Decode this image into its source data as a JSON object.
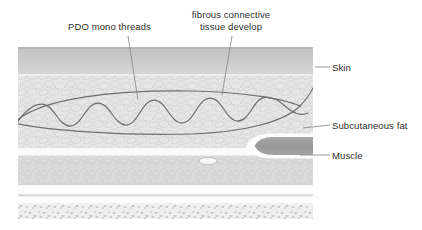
{
  "figure": {
    "callouts": [
      {
        "id": "pdo-mono-threads",
        "text": "PDO mono threads"
      },
      {
        "id": "fibrous-connective-tissue",
        "line1": "fibrous connective",
        "line2": "tissue develop"
      },
      {
        "id": "skin",
        "text": "Skin"
      },
      {
        "id": "subcutaneous-fat",
        "text": "Subcutaneous fat"
      },
      {
        "id": "muscle",
        "text": "Muscle"
      }
    ],
    "layers": [
      {
        "name": "skin",
        "label": "Skin"
      },
      {
        "name": "subcutaneous-fat",
        "label": "Subcutaneous fat"
      },
      {
        "name": "muscle",
        "label": "Muscle"
      },
      {
        "name": "deep-tissue",
        "label": ""
      }
    ],
    "colors": {
      "background": "#ffffff",
      "skin_band": "#c9c9c9",
      "fat_band": "#e2e2e2",
      "lower_band": "#d8d8d8",
      "muscle_band": "#9e9e9e",
      "deep_band": "#e8e8e8",
      "thread_stroke": "#6f6f6f",
      "leader_line": "#8a8a8a",
      "text": "#2e2e2e"
    }
  }
}
